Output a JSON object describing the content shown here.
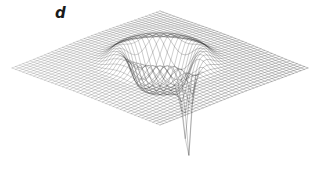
{
  "figure": {
    "panel_label": "d",
    "caption_visible": false,
    "background_color": "#ffffff",
    "line_color": "#2b2b2b",
    "width": 322,
    "height": 193
  },
  "chart_data": {
    "type": "surface",
    "title": "",
    "subtitle": "",
    "xlabel": "",
    "ylabel": "",
    "zlabel": "",
    "grid": true,
    "legend": false,
    "axes_visible": false,
    "tick_labels": [],
    "annotations": [
      {
        "text": "d",
        "x": 58,
        "y": 14,
        "style": "bold-italic"
      }
    ],
    "projection": {
      "type": "oblique-isometric",
      "center_x": 160,
      "center_y": 68,
      "half_width_x": 148,
      "half_width_y": 57,
      "z_scale": 46
    },
    "mesh": {
      "n_u": 42,
      "n_v": 42,
      "u_range": [
        -1,
        1
      ],
      "v_range": [
        -1,
        1
      ],
      "draw_u_lines": true,
      "draw_v_lines": true
    },
    "surface_corners": {
      "top": [
        133,
        10
      ],
      "right": [
        306,
        100
      ],
      "bottom": [
        170,
        126
      ],
      "left": [
        10,
        103
      ]
    },
    "features": [
      {
        "name": "crater",
        "kind": "gaussian-ring-depression",
        "center_u": 0.06,
        "center_v": -0.06,
        "rim_radius": 0.4,
        "rim_height": 0.3,
        "floor_depth": -0.55,
        "pixel_extent": {
          "x0": 118,
          "x1": 236,
          "y0": 22,
          "y1": 62
        }
      },
      {
        "name": "singularity-spike",
        "kind": "negative-pole",
        "center_u": 0.07,
        "center_v": 0.3,
        "radius": 0.055,
        "depth": -2.6,
        "tip_pixel": [
          172,
          186
        ]
      }
    ],
    "z_range": [
      -2.6,
      0.32
    ]
  }
}
